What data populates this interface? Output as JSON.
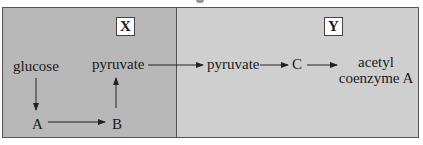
{
  "diagram": {
    "panels": [
      {
        "id": "X",
        "label": "X",
        "color": "#b8b8b8"
      },
      {
        "id": "Y",
        "label": "Y",
        "color": "#cfcfcf"
      }
    ],
    "nodes": {
      "glucose": "glucose",
      "pyruvate_x": "pyruvate",
      "a": "A",
      "b": "B",
      "pyruvate_y": "pyruvate",
      "c": "C",
      "acetyl_line1": "acetyl",
      "acetyl_line2": "coenzyme A"
    },
    "edges": [
      {
        "from": "glucose",
        "to": "A"
      },
      {
        "from": "A",
        "to": "B"
      },
      {
        "from": "B",
        "to": "pyruvate"
      },
      {
        "from": "pyruvate (X)",
        "to": "pyruvate (Y)"
      },
      {
        "from": "pyruvate (Y)",
        "to": "C"
      },
      {
        "from": "C",
        "to": "acetyl coenzyme A"
      }
    ]
  }
}
